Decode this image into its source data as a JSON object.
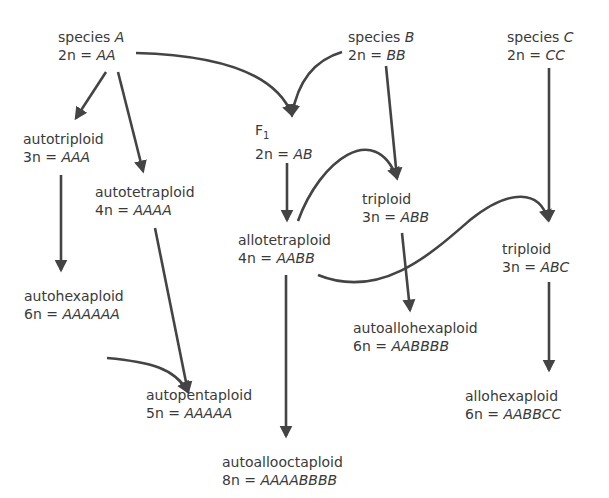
{
  "nodes": {
    "speciesA": {
      "label": "species",
      "letter": "A",
      "eq_prefix": "2n =",
      "genome": "AA"
    },
    "speciesB": {
      "label": "species",
      "letter": "B",
      "eq_prefix": "2n =",
      "genome": "BB"
    },
    "speciesC": {
      "label": "species",
      "letter": "C",
      "eq_prefix": "2n =",
      "genome": "CC"
    },
    "f1": {
      "label": "F",
      "sub": "1",
      "eq_prefix": "2n =",
      "genome": "AB"
    },
    "autotriploid": {
      "label": "autotriploid",
      "eq_prefix": "3n =",
      "genome": "AAA"
    },
    "autotetraploid": {
      "label": "autotetraploid",
      "eq_prefix": "4n =",
      "genome": "AAAA"
    },
    "allotetraploid": {
      "label": "allotetraploid",
      "eq_prefix": "4n =",
      "genome": "AABB"
    },
    "triploidABB": {
      "label": "triploid",
      "eq_prefix": "3n =",
      "genome": "ABB"
    },
    "triploidABC": {
      "label": "triploid",
      "eq_prefix": "3n =",
      "genome": "ABC"
    },
    "autohexaploid": {
      "label": "autohexaploid",
      "eq_prefix": "6n =",
      "genome": "AAAAAA"
    },
    "autoallohexaploid": {
      "label": "autoallohexaploid",
      "eq_prefix": "6n =",
      "genome": "AABBBB"
    },
    "autopentaploid": {
      "label": "autopentaploid",
      "eq_prefix": "5n =",
      "genome": "AAAAA"
    },
    "allohexaploid": {
      "label": "allohexaploid",
      "eq_prefix": "6n =",
      "genome": "AABBCC"
    },
    "autoallooctaploid": {
      "label": "autoallooctaploid",
      "eq_prefix": "8n =",
      "genome": "AAAABBBB"
    }
  },
  "edges": [
    {
      "from": "speciesA",
      "to": "autotriploid"
    },
    {
      "from": "speciesA",
      "to": "autotetraploid"
    },
    {
      "from": "speciesA",
      "to": "f1"
    },
    {
      "from": "speciesB",
      "to": "f1"
    },
    {
      "from": "speciesB",
      "to": "triploidABB"
    },
    {
      "from": "speciesC",
      "to": "triploidABC"
    },
    {
      "from": "f1",
      "to": "allotetraploid"
    },
    {
      "from": "allotetraploid",
      "to": "triploidABB"
    },
    {
      "from": "allotetraploid",
      "to": "triploidABC"
    },
    {
      "from": "allotetraploid",
      "to": "autoallooctaploid"
    },
    {
      "from": "autotriploid",
      "to": "autohexaploid"
    },
    {
      "from": "autohexaploid",
      "to": "autopentaploid"
    },
    {
      "from": "autotetraploid",
      "to": "autopentaploid"
    },
    {
      "from": "triploidABB",
      "to": "autoallohexaploid"
    },
    {
      "from": "triploidABC",
      "to": "allohexaploid"
    }
  ],
  "colors": {
    "line": "#444444",
    "text": "#3a3a3a",
    "background": "#ffffff"
  }
}
